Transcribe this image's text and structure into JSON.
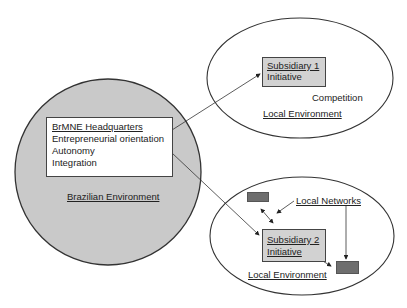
{
  "headquarters": {
    "title": "BrMNE Headquarters",
    "lines": [
      "Entrepreneurial orientation",
      "Autonomy",
      "Integration"
    ],
    "environment": "Brazilian Environment"
  },
  "subsidiary1": {
    "line1": "Subsidiary 1",
    "line2": "Initiative",
    "competition": "Competition",
    "environment": "Local Environment"
  },
  "subsidiary2": {
    "line1": "Subsidiary 2",
    "line2": "Initiative",
    "networks": "Local Networks",
    "environment": "Local Environment"
  },
  "colors": {
    "home_fill": "#c9c9c9",
    "subsidiary_box_fill": "#d2d2d2",
    "network_node_fill": "#6e6e6e",
    "line": "#333333"
  }
}
